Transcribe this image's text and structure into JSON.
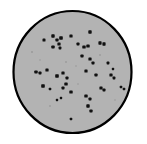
{
  "figure": {
    "background_color": "#ffffff"
  },
  "dish": {
    "name": "agar-plate",
    "fill_color": "#b3b3b3",
    "outline_color": "#000000",
    "outline_width": 2.2,
    "center_x": 72.5,
    "center_y": 72,
    "radius_x": 59,
    "radius_y": 61
  },
  "chart_data": {
    "type": "scatter",
    "subtitle": "",
    "xlabel": "",
    "ylabel": "",
    "xlim": [
      0,
      147
    ],
    "ylim": [
      0,
      144
    ],
    "grid": false,
    "legend": false,
    "legend_position": "none",
    "colony_count": 45,
    "marker_color": "#111111",
    "marker_shape": "rect",
    "series": [
      {
        "name": "colonies",
        "points": [
          {
            "x": 44,
            "y": 40,
            "w": 3.0,
            "h": 3.2
          },
          {
            "x": 53,
            "y": 36,
            "w": 3.4,
            "h": 3.4
          },
          {
            "x": 57,
            "y": 40,
            "w": 3.2,
            "h": 3.0
          },
          {
            "x": 61,
            "y": 38,
            "w": 3.6,
            "h": 3.4
          },
          {
            "x": 59,
            "y": 44,
            "w": 3.2,
            "h": 3.2
          },
          {
            "x": 53,
            "y": 47,
            "w": 3.4,
            "h": 3.0
          },
          {
            "x": 60,
            "y": 48,
            "w": 2.8,
            "h": 2.8
          },
          {
            "x": 71,
            "y": 36,
            "w": 3.2,
            "h": 3.2
          },
          {
            "x": 90,
            "y": 32,
            "w": 3.4,
            "h": 3.4
          },
          {
            "x": 78,
            "y": 44,
            "w": 3.0,
            "h": 3.0
          },
          {
            "x": 84,
            "y": 47,
            "w": 3.4,
            "h": 3.2
          },
          {
            "x": 88,
            "y": 46,
            "w": 3.4,
            "h": 3.2
          },
          {
            "x": 100,
            "y": 43,
            "w": 3.2,
            "h": 3.4
          },
          {
            "x": 104,
            "y": 44,
            "w": 3.2,
            "h": 3.4
          },
          {
            "x": 82,
            "y": 56,
            "w": 3.2,
            "h": 3.0
          },
          {
            "x": 90,
            "y": 59,
            "w": 3.2,
            "h": 3.2
          },
          {
            "x": 93,
            "y": 63,
            "w": 3.0,
            "h": 3.0
          },
          {
            "x": 108,
            "y": 63,
            "w": 2.8,
            "h": 2.8
          },
          {
            "x": 36,
            "y": 72,
            "w": 3.4,
            "h": 3.0
          },
          {
            "x": 40,
            "y": 73,
            "w": 3.0,
            "h": 3.0
          },
          {
            "x": 47,
            "y": 70,
            "w": 3.2,
            "h": 3.2
          },
          {
            "x": 57,
            "y": 76,
            "w": 3.6,
            "h": 3.4
          },
          {
            "x": 63,
            "y": 73,
            "w": 3.2,
            "h": 3.2
          },
          {
            "x": 67,
            "y": 78,
            "w": 3.0,
            "h": 3.0
          },
          {
            "x": 66,
            "y": 84,
            "w": 3.4,
            "h": 3.2
          },
          {
            "x": 63,
            "y": 88,
            "w": 3.0,
            "h": 3.0
          },
          {
            "x": 43,
            "y": 86,
            "w": 3.6,
            "h": 3.6
          },
          {
            "x": 50,
            "y": 89,
            "w": 2.6,
            "h": 2.6
          },
          {
            "x": 71,
            "y": 92,
            "w": 3.4,
            "h": 3.2
          },
          {
            "x": 86,
            "y": 71,
            "w": 3.2,
            "h": 3.2
          },
          {
            "x": 96,
            "y": 75,
            "w": 3.2,
            "h": 3.0
          },
          {
            "x": 111,
            "y": 75,
            "w": 3.2,
            "h": 3.2
          },
          {
            "x": 114,
            "y": 78,
            "w": 2.8,
            "h": 2.8
          },
          {
            "x": 113,
            "y": 69,
            "w": 2.4,
            "h": 2.4
          },
          {
            "x": 101,
            "y": 88,
            "w": 3.2,
            "h": 3.2
          },
          {
            "x": 104,
            "y": 90,
            "w": 3.0,
            "h": 3.0
          },
          {
            "x": 121,
            "y": 87,
            "w": 2.6,
            "h": 2.6
          },
          {
            "x": 124,
            "y": 89,
            "w": 2.6,
            "h": 2.6
          },
          {
            "x": 57,
            "y": 100,
            "w": 2.4,
            "h": 2.4
          },
          {
            "x": 61,
            "y": 98,
            "w": 2.4,
            "h": 2.4
          },
          {
            "x": 86,
            "y": 96,
            "w": 3.4,
            "h": 3.2
          },
          {
            "x": 90,
            "y": 99,
            "w": 3.0,
            "h": 3.0
          },
          {
            "x": 88,
            "y": 106,
            "w": 3.4,
            "h": 3.4
          },
          {
            "x": 91,
            "y": 111,
            "w": 3.2,
            "h": 3.0
          },
          {
            "x": 71,
            "y": 119,
            "w": 2.6,
            "h": 2.6
          }
        ]
      }
    ],
    "specks": [
      {
        "x": 32,
        "y": 52,
        "r": 1.0
      },
      {
        "x": 66,
        "y": 62,
        "r": 0.9
      },
      {
        "x": 100,
        "y": 55,
        "r": 0.9
      },
      {
        "x": 50,
        "y": 106,
        "r": 0.9
      },
      {
        "x": 78,
        "y": 84,
        "r": 0.8
      },
      {
        "x": 115,
        "y": 100,
        "r": 0.8
      },
      {
        "x": 40,
        "y": 60,
        "r": 0.8
      },
      {
        "x": 76,
        "y": 66,
        "r": 0.8
      }
    ]
  }
}
